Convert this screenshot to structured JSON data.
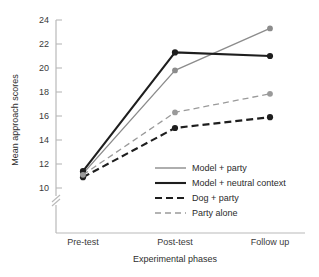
{
  "chart_data": {
    "type": "line",
    "title": "",
    "xlabel": "Experimental phases",
    "ylabel": "Mean approach scores",
    "categories": [
      "Pre-test",
      "Post-test",
      "Follow up"
    ],
    "ylim": [
      9,
      24
    ],
    "yticks": [
      10,
      12,
      14,
      16,
      18,
      20,
      22,
      24
    ],
    "ytick_labels": [
      "10",
      "12",
      "14",
      "16",
      "18",
      "20",
      "22",
      "24"
    ],
    "axis_break": true,
    "grid": false,
    "legend_position": "inside-lower-right",
    "series": [
      {
        "name": "Model + party",
        "values": [
          11.2,
          19.8,
          23.3
        ],
        "color": "#8c8c8c",
        "style": "solid",
        "width": 1.4,
        "marker": "circle"
      },
      {
        "name": "Model + neutral context",
        "values": [
          11.4,
          21.3,
          21.0
        ],
        "color": "#1e1e1e",
        "style": "solid",
        "width": 2.1,
        "marker": "circle"
      },
      {
        "name": "Dog + party",
        "values": [
          10.9,
          15.0,
          15.9
        ],
        "color": "#1e1e1e",
        "style": "dashed",
        "width": 2.1,
        "marker": "circle"
      },
      {
        "name": "Party alone",
        "values": [
          11.1,
          16.3,
          17.85
        ],
        "color": "#9a9a9a",
        "style": "dashed",
        "width": 1.3,
        "marker": "circle"
      }
    ]
  },
  "legend": {
    "items": [
      {
        "label": "Model + party"
      },
      {
        "label": "Model + neutral context"
      },
      {
        "label": "Dog + party"
      },
      {
        "label": "Party alone"
      }
    ]
  }
}
